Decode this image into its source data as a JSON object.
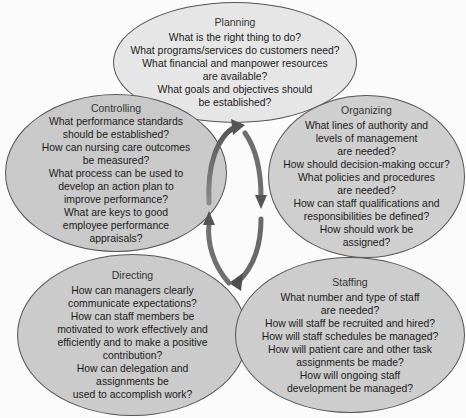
{
  "diagram": {
    "type": "management-process-cycle",
    "colors": {
      "planning_fill": "#e6e6e6",
      "ellipse_fill": "#cbcbcb",
      "ellipse_border": "#555555",
      "arrow": "#6a6a6a",
      "background": "#fbfbfb"
    },
    "nodes": {
      "planning": {
        "title": "Planning",
        "lines": [
          "What is the right thing to do?",
          "What programs/services do customers need?",
          "What financial and manpower resources",
          "are available?",
          "What goals and objectives should",
          "be established?"
        ]
      },
      "organizing": {
        "title": "Organizing",
        "lines": [
          "What lines of authority and",
          "levels of management",
          "are needed?",
          "How should decision-making occur?",
          "What policies and procedures",
          "are needed?",
          "How can staff qualifications and",
          "responsibilities be defined?",
          "How should work be",
          "assigned?"
        ]
      },
      "staffing": {
        "title": "Staffing",
        "lines": [
          "What number and type of staff",
          "are needed?",
          "How will staff be recruited and hired?",
          "How will staff schedules be managed?",
          "How will patient care and other task",
          "assignments be made?",
          "How will ongoing staff",
          "development be managed?"
        ]
      },
      "directing": {
        "title": "Directing",
        "lines": [
          "How can managers clearly",
          "communicate expectations?",
          "How can staff members be",
          "motivated to work effectively and",
          "efficiently and to make a positive",
          "contribution?",
          "How can delegation and",
          "assignments be",
          "used to accomplish work?"
        ]
      },
      "controlling": {
        "title": "Controlling",
        "lines": [
          "What performance standards",
          "should be established?",
          "How can nursing care outcomes",
          "be measured?",
          "What process can be used to",
          "develop an action plan to",
          "improve performance?",
          "What are keys to good",
          "employee performance",
          "appraisals?"
        ]
      }
    },
    "cycle_arrows": {
      "direction": "clockwise",
      "icon": "circular-cycle-arrows-icon"
    }
  }
}
